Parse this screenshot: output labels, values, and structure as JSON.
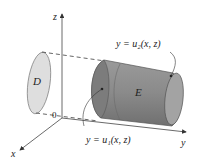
{
  "diagram": {
    "axes": {
      "z_label": "z",
      "y_label": "y",
      "x_label": "x",
      "origin_label": "0"
    },
    "regions": {
      "projection_label": "D",
      "solid_label": "E"
    },
    "annotations": {
      "upper_surface": "y = u₂(x, z)",
      "lower_surface": "y = u₁(x, z)"
    },
    "colors": {
      "axis": "#444444",
      "solid_fill": "#8f8f8f",
      "solid_dark": "#6e6e6e",
      "projection_fill": "#dcdcdc",
      "dash": "#555555"
    }
  }
}
